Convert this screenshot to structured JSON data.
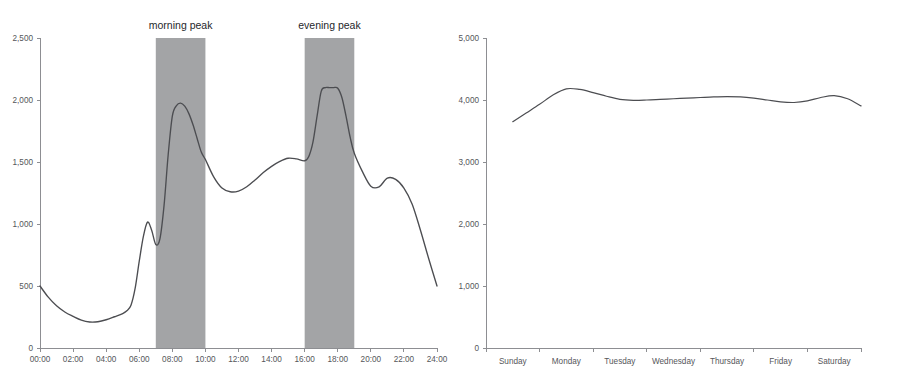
{
  "chart_data": [
    {
      "id": "daily-profile",
      "type": "line",
      "title": "",
      "xlabel": "",
      "ylabel": "",
      "ylim": [
        0,
        2500
      ],
      "y_ticks": [
        0,
        500,
        1000,
        1500,
        2000,
        2500
      ],
      "y_tick_labels": [
        "0",
        "500",
        "1,000",
        "1,500",
        "2,000",
        "2,500"
      ],
      "xlim": [
        0,
        24
      ],
      "x_ticks": [
        0,
        2,
        4,
        6,
        8,
        10,
        12,
        14,
        16,
        18,
        20,
        22,
        24
      ],
      "x_tick_labels": [
        "00:00",
        "02:00",
        "04:00",
        "06:00",
        "08:00",
        "10:00",
        "12:00",
        "14:00",
        "16:00",
        "18:00",
        "20:00",
        "22:00",
        "24:00"
      ],
      "grid": false,
      "legend": "none",
      "x": [
        0,
        0.5,
        1,
        1.5,
        2,
        2.5,
        3,
        3.5,
        4,
        4.5,
        5,
        5.25,
        5.5,
        5.75,
        6,
        6.25,
        6.5,
        6.75,
        7,
        7.25,
        7.5,
        7.75,
        8,
        8.25,
        8.5,
        8.75,
        9,
        9.25,
        9.5,
        9.75,
        10,
        10.5,
        11,
        11.5,
        12,
        12.5,
        13,
        13.5,
        14,
        14.5,
        15,
        15.5,
        16,
        16.25,
        16.5,
        16.75,
        17,
        17.25,
        17.5,
        17.75,
        18,
        18.25,
        18.5,
        18.75,
        19,
        19.5,
        20,
        20.5,
        21,
        21.5,
        22,
        22.5,
        23,
        23.5,
        24
      ],
      "values": [
        500,
        410,
        340,
        290,
        255,
        225,
        210,
        212,
        228,
        252,
        278,
        300,
        345,
        480,
        700,
        900,
        1015,
        950,
        835,
        880,
        1150,
        1560,
        1870,
        1955,
        1975,
        1950,
        1890,
        1800,
        1690,
        1580,
        1520,
        1380,
        1290,
        1260,
        1265,
        1300,
        1355,
        1415,
        1465,
        1505,
        1530,
        1525,
        1510,
        1545,
        1660,
        1870,
        2070,
        2100,
        2100,
        2100,
        2095,
        2020,
        1870,
        1700,
        1570,
        1420,
        1305,
        1300,
        1370,
        1360,
        1290,
        1160,
        950,
        720,
        500
      ],
      "annotations": [
        {
          "label": "morning peak",
          "x_start": 7,
          "x_end": 10,
          "type": "shaded-band"
        },
        {
          "label": "evening peak",
          "x_start": 16,
          "x_end": 19,
          "type": "shaded-band"
        }
      ]
    },
    {
      "id": "weekly-profile",
      "type": "line",
      "title": "",
      "xlabel": "",
      "ylabel": "",
      "ylim": [
        0,
        5000
      ],
      "y_ticks": [
        0,
        1000,
        2000,
        3000,
        4000,
        5000
      ],
      "y_tick_labels": [
        "0",
        "1,000",
        "2,000",
        "3,000",
        "4,000",
        "5,000"
      ],
      "grid": false,
      "legend": "none",
      "categories": [
        "Sunday",
        "Monday",
        "Tuesday",
        "Wednesday",
        "Thursday",
        "Friday",
        "Saturday"
      ],
      "x": [
        0.0,
        0.25,
        0.5,
        0.75,
        1.0,
        1.25,
        1.5,
        1.75,
        2.0,
        2.25,
        2.5,
        2.75,
        3.0,
        3.25,
        3.5,
        3.75,
        4.0,
        4.25,
        4.5,
        4.75,
        5.0,
        5.25,
        5.5,
        5.75,
        6.0,
        6.25,
        6.5
      ],
      "values": [
        3650,
        3790,
        3930,
        4080,
        4180,
        4170,
        4120,
        4060,
        4010,
        3995,
        4000,
        4010,
        4020,
        4030,
        4040,
        4050,
        4055,
        4050,
        4030,
        4000,
        3970,
        3960,
        3985,
        4040,
        4070,
        4020,
        3905
      ]
    }
  ],
  "panels": {
    "left": {
      "name": "daily-load-profile-chart",
      "band_morning_label": "morning peak",
      "band_evening_label": "evening peak"
    },
    "right": {
      "name": "weekly-load-profile-chart"
    }
  }
}
